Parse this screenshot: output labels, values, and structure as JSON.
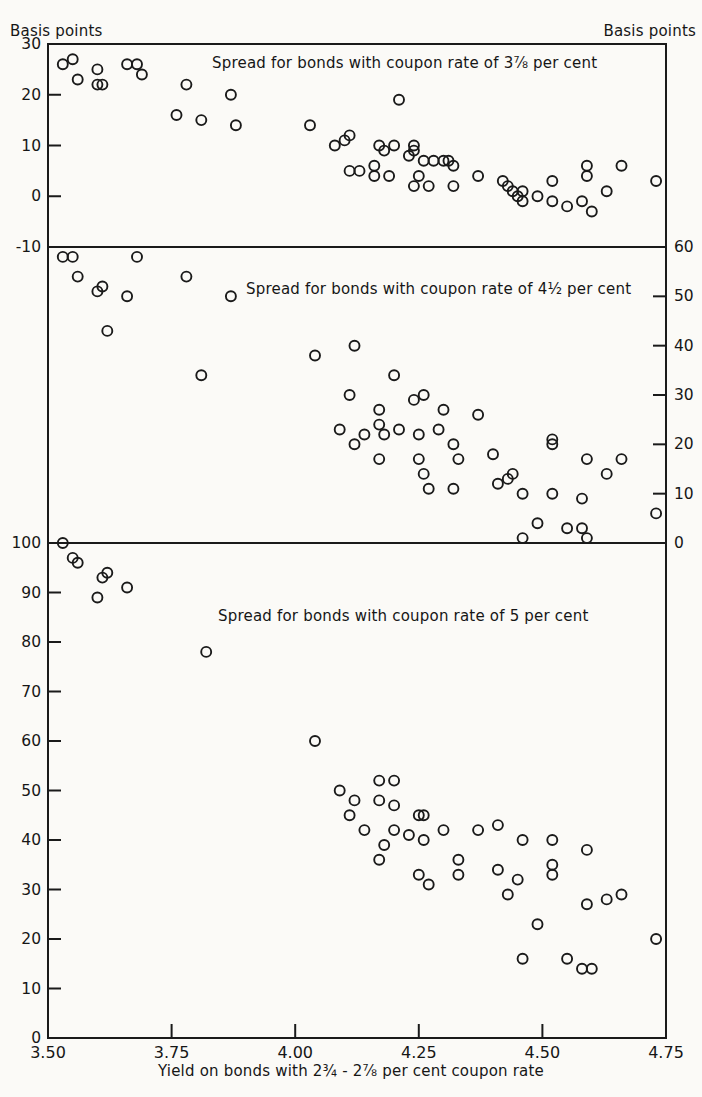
{
  "page": {
    "left_axis_header": "Basis points",
    "right_axis_header": "Basis points"
  },
  "x_axis": {
    "label": "Yield on bonds with 2¾ - 2⅞ per cent coupon rate",
    "ticks": [
      {
        "value": 3.5,
        "label": "3.50"
      },
      {
        "value": 3.75,
        "label": "3.75"
      },
      {
        "value": 4.0,
        "label": "4.00"
      },
      {
        "value": 4.25,
        "label": "4.25"
      },
      {
        "value": 4.5,
        "label": "4.50"
      },
      {
        "value": 4.75,
        "label": "4.75"
      }
    ]
  },
  "style": {
    "ink_color": "#1a1a1a",
    "paper_color": "#fbfaf7",
    "marker": "open-circle",
    "marker_radius": 5
  },
  "chart_data": [
    {
      "type": "scatter",
      "title": "Spread for bonds with coupon rate of 3⅞ per cent",
      "ylabel": "Basis points",
      "xlabel": "Yield on bonds with 2¾ - 2⅞ per cent coupon rate",
      "y_axis_side": "left",
      "ylim": [
        -10,
        30
      ],
      "yticks": [
        30,
        20,
        10,
        0,
        -10
      ],
      "xlim": [
        3.5,
        4.75
      ],
      "grid": false,
      "points": [
        [
          3.53,
          26
        ],
        [
          3.55,
          27
        ],
        [
          3.56,
          23
        ],
        [
          3.6,
          25
        ],
        [
          3.6,
          22
        ],
        [
          3.61,
          22
        ],
        [
          3.66,
          26
        ],
        [
          3.68,
          26
        ],
        [
          3.69,
          24
        ],
        [
          3.76,
          16
        ],
        [
          3.78,
          22
        ],
        [
          3.81,
          15
        ],
        [
          3.87,
          20
        ],
        [
          3.88,
          14
        ],
        [
          4.03,
          14
        ],
        [
          4.08,
          10
        ],
        [
          4.1,
          11
        ],
        [
          4.11,
          12
        ],
        [
          4.11,
          5
        ],
        [
          4.13,
          5
        ],
        [
          4.16,
          6
        ],
        [
          4.16,
          4
        ],
        [
          4.17,
          10
        ],
        [
          4.18,
          9
        ],
        [
          4.19,
          4
        ],
        [
          4.2,
          10
        ],
        [
          4.21,
          19
        ],
        [
          4.23,
          8
        ],
        [
          4.24,
          10
        ],
        [
          4.24,
          9
        ],
        [
          4.24,
          2
        ],
        [
          4.25,
          4
        ],
        [
          4.26,
          7
        ],
        [
          4.27,
          2
        ],
        [
          4.28,
          7
        ],
        [
          4.3,
          7
        ],
        [
          4.31,
          7
        ],
        [
          4.32,
          6
        ],
        [
          4.32,
          2
        ],
        [
          4.37,
          4
        ],
        [
          4.42,
          3
        ],
        [
          4.43,
          2
        ],
        [
          4.44,
          1
        ],
        [
          4.45,
          0
        ],
        [
          4.46,
          1
        ],
        [
          4.46,
          -1
        ],
        [
          4.49,
          0
        ],
        [
          4.52,
          3
        ],
        [
          4.52,
          -1
        ],
        [
          4.55,
          -2
        ],
        [
          4.58,
          -1
        ],
        [
          4.59,
          6
        ],
        [
          4.59,
          4
        ],
        [
          4.6,
          -3
        ],
        [
          4.63,
          1
        ],
        [
          4.66,
          6
        ],
        [
          4.73,
          3
        ]
      ]
    },
    {
      "type": "scatter",
      "title": "Spread for bonds with coupon rate of 4½ per cent",
      "ylabel": "Basis points",
      "xlabel": "Yield on bonds with 2¾ - 2⅞ per cent coupon rate",
      "y_axis_side": "right",
      "ylim": [
        0,
        60
      ],
      "yticks": [
        60,
        50,
        40,
        30,
        20,
        10,
        0
      ],
      "xlim": [
        3.5,
        4.75
      ],
      "grid": false,
      "points": [
        [
          3.53,
          58
        ],
        [
          3.55,
          58
        ],
        [
          3.56,
          54
        ],
        [
          3.6,
          51
        ],
        [
          3.61,
          52
        ],
        [
          3.62,
          43
        ],
        [
          3.66,
          50
        ],
        [
          3.68,
          58
        ],
        [
          3.78,
          54
        ],
        [
          3.81,
          34
        ],
        [
          3.87,
          50
        ],
        [
          4.04,
          38
        ],
        [
          4.09,
          23
        ],
        [
          4.11,
          30
        ],
        [
          4.12,
          40
        ],
        [
          4.12,
          20
        ],
        [
          4.14,
          22
        ],
        [
          4.17,
          27
        ],
        [
          4.17,
          24
        ],
        [
          4.17,
          17
        ],
        [
          4.18,
          22
        ],
        [
          4.2,
          34
        ],
        [
          4.21,
          23
        ],
        [
          4.24,
          29
        ],
        [
          4.25,
          22
        ],
        [
          4.25,
          17
        ],
        [
          4.26,
          30
        ],
        [
          4.26,
          14
        ],
        [
          4.27,
          11
        ],
        [
          4.29,
          23
        ],
        [
          4.3,
          27
        ],
        [
          4.32,
          20
        ],
        [
          4.32,
          11
        ],
        [
          4.33,
          17
        ],
        [
          4.37,
          26
        ],
        [
          4.4,
          18
        ],
        [
          4.41,
          12
        ],
        [
          4.43,
          13
        ],
        [
          4.44,
          14
        ],
        [
          4.46,
          10
        ],
        [
          4.46,
          1
        ],
        [
          4.49,
          4
        ],
        [
          4.52,
          21
        ],
        [
          4.52,
          20
        ],
        [
          4.52,
          10
        ],
        [
          4.55,
          3
        ],
        [
          4.58,
          9
        ],
        [
          4.58,
          3
        ],
        [
          4.59,
          17
        ],
        [
          4.59,
          1
        ],
        [
          4.63,
          14
        ],
        [
          4.66,
          17
        ],
        [
          4.73,
          6
        ]
      ]
    },
    {
      "type": "scatter",
      "title": "Spread for bonds with coupon rate of 5 per cent",
      "ylabel": "Basis points",
      "xlabel": "Yield on bonds with 2¾ - 2⅞ per cent coupon rate",
      "y_axis_side": "left",
      "ylim": [
        0,
        100
      ],
      "yticks": [
        100,
        90,
        80,
        70,
        60,
        50,
        40,
        30,
        20,
        10,
        0
      ],
      "xlim": [
        3.5,
        4.75
      ],
      "grid": false,
      "points": [
        [
          3.53,
          100
        ],
        [
          3.55,
          97
        ],
        [
          3.56,
          96
        ],
        [
          3.6,
          89
        ],
        [
          3.61,
          93
        ],
        [
          3.62,
          94
        ],
        [
          3.66,
          91
        ],
        [
          3.82,
          78
        ],
        [
          4.04,
          60
        ],
        [
          4.09,
          50
        ],
        [
          4.11,
          45
        ],
        [
          4.12,
          48
        ],
        [
          4.14,
          42
        ],
        [
          4.17,
          52
        ],
        [
          4.17,
          48
        ],
        [
          4.17,
          36
        ],
        [
          4.18,
          39
        ],
        [
          4.2,
          52
        ],
        [
          4.2,
          47
        ],
        [
          4.2,
          42
        ],
        [
          4.23,
          41
        ],
        [
          4.25,
          45
        ],
        [
          4.25,
          33
        ],
        [
          4.26,
          45
        ],
        [
          4.26,
          40
        ],
        [
          4.27,
          31
        ],
        [
          4.3,
          42
        ],
        [
          4.33,
          36
        ],
        [
          4.33,
          33
        ],
        [
          4.37,
          42
        ],
        [
          4.41,
          43
        ],
        [
          4.41,
          34
        ],
        [
          4.43,
          29
        ],
        [
          4.45,
          32
        ],
        [
          4.46,
          40
        ],
        [
          4.46,
          16
        ],
        [
          4.49,
          23
        ],
        [
          4.52,
          40
        ],
        [
          4.52,
          35
        ],
        [
          4.52,
          33
        ],
        [
          4.55,
          16
        ],
        [
          4.58,
          14
        ],
        [
          4.59,
          38
        ],
        [
          4.59,
          27
        ],
        [
          4.6,
          14
        ],
        [
          4.63,
          28
        ],
        [
          4.66,
          29
        ],
        [
          4.73,
          20
        ]
      ]
    }
  ]
}
